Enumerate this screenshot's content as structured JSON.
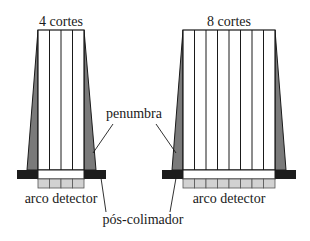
{
  "diagram": {
    "colors": {
      "outline": "#1a1a1a",
      "penumbra": "#7a7a7a",
      "collimator": "#1c1c1c",
      "detector_cell": "#d2d2d2",
      "beam": "#ffffff"
    },
    "left": {
      "title": "4 cortes",
      "slices": 4
    },
    "right": {
      "title": "8 cortes",
      "slices": 8
    },
    "labels": {
      "penumbra": "penumbra",
      "detector_left": "arco detector",
      "detector_right": "arco detector",
      "post_collimator": "pós-colimador"
    }
  }
}
